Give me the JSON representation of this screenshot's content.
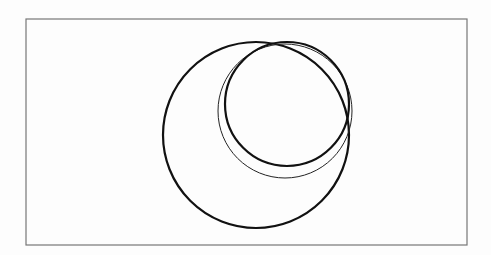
{
  "diagram": {
    "type": "nested-circles",
    "frame": {
      "x": 26,
      "y": 19,
      "width": 441,
      "height": 226,
      "stroke": "#777777"
    },
    "circles": [
      {
        "name": "large-circle",
        "cx": 256,
        "cy": 135,
        "r": 93,
        "stroke": "#111111",
        "stroke_width": 2.2
      },
      {
        "name": "thin-circle",
        "cx": 285,
        "cy": 111,
        "r": 67,
        "stroke": "#222222",
        "stroke_width": 1
      },
      {
        "name": "small-circle",
        "cx": 287,
        "cy": 104,
        "r": 62,
        "stroke": "#111111",
        "stroke_width": 2.2
      }
    ],
    "tangent_point": {
      "x": 270,
      "y": 42
    }
  },
  "background_bleed_text": ""
}
